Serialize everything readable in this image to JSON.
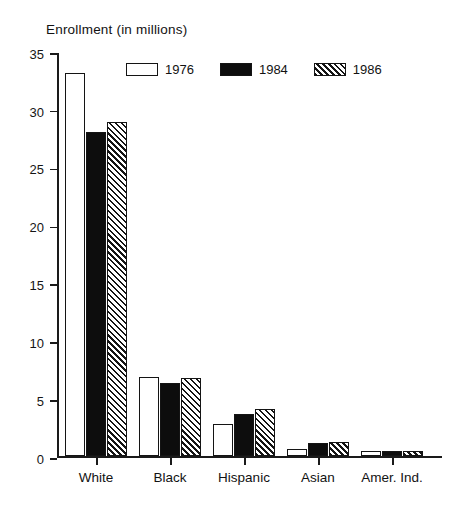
{
  "chart_data": {
    "type": "bar",
    "title": "Enrollment (in millions)",
    "xlabel": "",
    "ylabel": "",
    "ylim": [
      0,
      35
    ],
    "ytick_step": 5,
    "yticks": [
      35,
      30,
      25,
      20,
      15,
      10,
      5,
      0
    ],
    "ytick_labels": [
      "35",
      "30",
      "25",
      "20",
      "15",
      "10",
      "5",
      "0"
    ],
    "grid": false,
    "legend_position": "top-center",
    "categories": [
      "White",
      "Black",
      "Hispanic",
      "Asian",
      "Amer. Ind."
    ],
    "series": [
      {
        "name": "1976",
        "fill": "white-outlined",
        "values": [
          33.1,
          6.8,
          2.8,
          0.6,
          0.4
        ]
      },
      {
        "name": "1984",
        "fill": "solid-black",
        "values": [
          28.0,
          6.3,
          3.6,
          1.1,
          0.4
        ]
      },
      {
        "name": "1986",
        "fill": "diagonal-hatch",
        "values": [
          28.9,
          6.7,
          4.1,
          1.2,
          0.45
        ]
      }
    ],
    "colors": {
      "axis": "#1a1a1a",
      "text": "#121212",
      "series_1976": "#ffffff",
      "series_1984": "#0d0d0d",
      "series_1986": "#ffffff",
      "hatch": "#141414",
      "background": "#ffffff"
    }
  }
}
